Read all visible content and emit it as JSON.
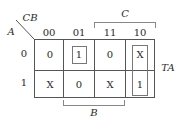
{
  "kmap": {
    "corner_top": "CB",
    "corner_left": "A",
    "col_headers": [
      "00",
      "01",
      "11",
      "10"
    ],
    "row_headers": [
      "0",
      "1"
    ],
    "cells": [
      [
        "0",
        "1",
        "0",
        "X"
      ],
      [
        "X",
        "0",
        "X",
        "1"
      ]
    ],
    "group_labels": {
      "top": "C",
      "right": "TA",
      "bottom": "B"
    }
  }
}
